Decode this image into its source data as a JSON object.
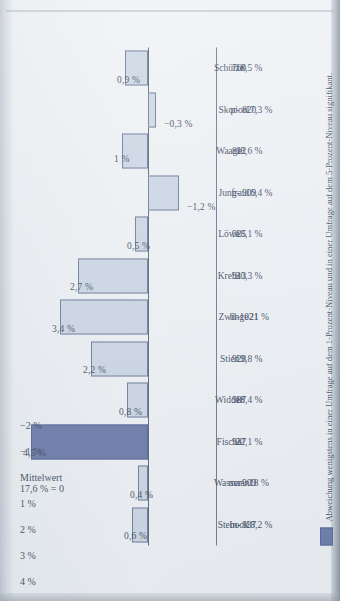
{
  "chart_data": {
    "type": "bar",
    "title": "",
    "xlabel": "",
    "ylabel": "",
    "ylim": [
      -2,
      5
    ],
    "grid": false,
    "legend_position": "bottom",
    "baseline_label": "Mittelwert\n17,6 % = 0",
    "categories": [
      "Stein-\nbock",
      "Wasser-\nmann",
      "Fische",
      "Widder",
      "Stier",
      "Zwil-\nlinge",
      "Krebs",
      "Löwe",
      "Jung-\nfrau",
      "Waage",
      "Skor-\npion",
      "Schütze"
    ],
    "category_lines": [
      [
        "Stein-",
        "bock"
      ],
      [
        "Wasser-",
        "mann"
      ],
      [
        "Fische"
      ],
      [
        "Widder"
      ],
      [
        "Stier"
      ],
      [
        "Zwil-",
        "linge"
      ],
      [
        "Krebs"
      ],
      [
        "Löwe"
      ],
      [
        "Jung-",
        "frau"
      ],
      [
        "Waage"
      ],
      [
        "Skor-",
        "pion"
      ],
      [
        "Schütze"
      ]
    ],
    "counts": [
      837,
      909,
      937,
      987,
      928,
      1021,
      913,
      925,
      909,
      812,
      820,
      760
    ],
    "percentages": [
      "18,2 %",
      "18 %",
      "22,1 %",
      "18,4 %",
      "19,8 %",
      "21 %",
      "20,3 %",
      "18,1 %",
      "16,4 %",
      "18,6 %",
      "17,3 %",
      "18,5 %"
    ],
    "values": [
      0.6,
      0.4,
      4.5,
      0.8,
      2.2,
      3.4,
      2.7,
      0.5,
      -1.2,
      1.0,
      -0.3,
      0.9
    ],
    "value_labels": [
      "0,6 %",
      "0,4 %",
      "4,5 %",
      "0,8 %",
      "2,2 %",
      "3,4 %",
      "2,7 %",
      "0,5 %",
      "−1,2 %",
      "1 %",
      "−0,3 %",
      "0,9 %"
    ],
    "highlighted": [
      false,
      false,
      true,
      false,
      false,
      false,
      false,
      false,
      false,
      false,
      false,
      false
    ],
    "yticks": [
      5,
      4,
      3,
      2,
      1,
      0,
      -1,
      -2
    ],
    "ytick_labels": [
      "5 %",
      "4 %",
      "3 %",
      "2 %",
      "1 %",
      "Mittelwert 17,6 % = 0",
      "−1 %",
      "−2 %"
    ],
    "colors": {
      "bar_fill": "#c7d2e1",
      "bar_border": "#5d6d8c",
      "bar_highlight": "#5a6a9e",
      "bar_highlight_border": "#44528a",
      "axis": "#47536b",
      "text": "#2e384f",
      "page": "#eceff3"
    }
  },
  "legend": {
    "swatch_name": "legend-swatch-significant",
    "note": "Abweichung wenigstens in einer Umfrage auf dem 1-Prozent-Niveau und in einer Umfrage auf dem 5-Prozent-Niveau signifikant."
  }
}
